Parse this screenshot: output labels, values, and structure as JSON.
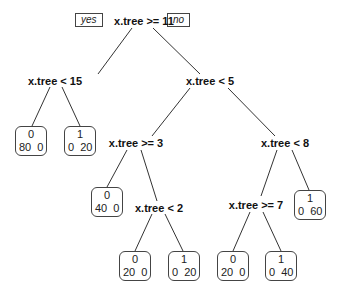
{
  "diagram": {
    "type": "decision-tree",
    "branch_labels": {
      "yes": "yes",
      "no": "no"
    },
    "nodes": {
      "root": {
        "label": "x.tree >= 11"
      },
      "n_lt15": {
        "label": "x.tree < 15"
      },
      "n_lt5": {
        "label": "x.tree < 5"
      },
      "n_ge3": {
        "label": "x.tree >= 3"
      },
      "n_lt2": {
        "label": "x.tree < 2"
      },
      "n_lt8": {
        "label": "x.tree < 8"
      },
      "n_ge7": {
        "label": "x.tree >= 7"
      }
    },
    "leaves": [
      {
        "class": "0",
        "counts": "80  0"
      },
      {
        "class": "1",
        "counts": "0  20"
      },
      {
        "class": "0",
        "counts": "40  0"
      },
      {
        "class": "0",
        "counts": "20  0"
      },
      {
        "class": "1",
        "counts": "0  20"
      },
      {
        "class": "0",
        "counts": "20  0"
      },
      {
        "class": "1",
        "counts": "0  40"
      },
      {
        "class": "1",
        "counts": "0  60"
      }
    ]
  }
}
